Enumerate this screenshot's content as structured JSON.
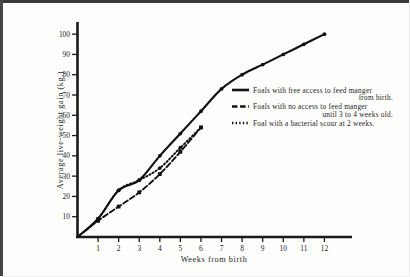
{
  "figure": {
    "background_color": "#fdfdfc",
    "ink_color": "#1a1a1a"
  },
  "chart_data": {
    "type": "line",
    "title": "",
    "xlabel": "Weeks from birth",
    "ylabel": "Average live-weight gain (kg.)",
    "xlim": [
      0,
      13
    ],
    "ylim": [
      0,
      105
    ],
    "grid": false,
    "legend_position": "right",
    "xticks": [
      1,
      2,
      3,
      4,
      5,
      6,
      7,
      8,
      9,
      10,
      11,
      12
    ],
    "xtick_labels": [
      "1",
      "2",
      "3",
      "4",
      "5",
      "6",
      "7",
      "8",
      "9",
      "10",
      "11",
      "12"
    ],
    "yticks": [
      10,
      20,
      30,
      40,
      50,
      60,
      70,
      80,
      90,
      100
    ],
    "ytick_labels": [
      "10",
      "20",
      "30",
      "40",
      "50",
      "60",
      "70",
      "80",
      "90",
      "100"
    ],
    "series": [
      {
        "name": "Foals with free access to feed manger from birth.",
        "style": "solid",
        "marker": "dot",
        "x": [
          0,
          1,
          2,
          3,
          4,
          5,
          6,
          7,
          8,
          9,
          10,
          11,
          12
        ],
        "y": [
          0,
          9,
          23,
          28,
          40,
          51,
          62,
          73,
          80,
          85,
          90,
          95,
          100
        ]
      },
      {
        "name": "Foals with no access to feed manger until 3 to 4 weeks old.",
        "style": "dashed",
        "marker": "square",
        "x": [
          0,
          1,
          2,
          3,
          4,
          5,
          6
        ],
        "y": [
          0,
          8,
          15,
          22,
          31,
          42,
          54
        ]
      },
      {
        "name": "Foal with a bacterial scour at 2 weeks.",
        "style": "dotted",
        "marker": "dot",
        "x": [
          0,
          1,
          2,
          3,
          4,
          5,
          6
        ],
        "y": [
          0,
          9,
          23,
          28,
          34,
          44,
          54
        ]
      }
    ]
  },
  "legend": {
    "entries": [
      {
        "style": "solid",
        "line1": "Foals with free access to feed manger",
        "line2": "from birth."
      },
      {
        "style": "dashed",
        "line1": "Foals with no access to feed manger",
        "line2": "until 3 to 4 weeks old."
      },
      {
        "style": "dotted",
        "line1": "Foal with a bacterial scour at 2 weeks.",
        "line2": ""
      }
    ]
  }
}
